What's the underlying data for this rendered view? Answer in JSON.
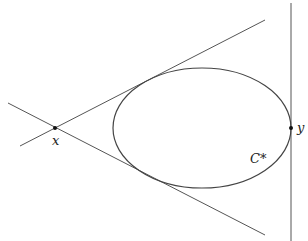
{
  "diagram": {
    "labels": {
      "point_x": "x",
      "point_y": "y",
      "conic": "C*"
    },
    "colors": {
      "stroke": "#444444",
      "point": "#111111",
      "background": "#ffffff"
    }
  }
}
